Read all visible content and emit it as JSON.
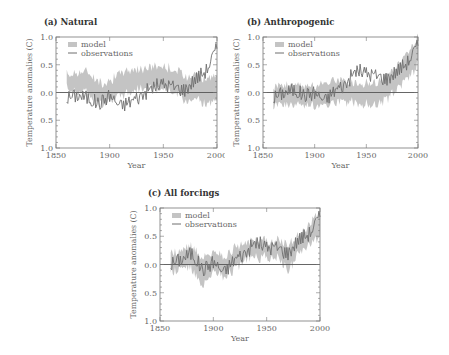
{
  "figure": {
    "panels": [
      {
        "id": "a",
        "title": "(a) Natural"
      },
      {
        "id": "b",
        "title": "(b) Anthropogenic"
      },
      {
        "id": "c",
        "title": "(c) All forcings"
      }
    ],
    "legend": {
      "model": "model",
      "observations": "observations"
    },
    "xlabel": "Year",
    "ylabel": "Temperature anomalies (C)",
    "xticks": [
      "1850",
      "1900",
      "1950",
      "2000"
    ],
    "yticks": [
      "1.0",
      "0.5",
      "0.0",
      "0.5",
      "1.0"
    ],
    "colors": {
      "model_band": "#c4c4c4",
      "observations": "#6e6e6e",
      "axis": "#777777",
      "zero_line": "#555555"
    }
  },
  "chart_data": [
    {
      "type": "line",
      "title": "(a) Natural",
      "xlabel": "Year",
      "ylabel": "Temperature anomalies (C)",
      "xlim": [
        1850,
        2000
      ],
      "ylim": [
        -1.0,
        1.0
      ],
      "xticks": [
        1850,
        1900,
        1950,
        2000
      ],
      "yticks": [
        1.0,
        0.5,
        0.0,
        -0.5,
        -1.0
      ],
      "ytick_labels": [
        "1.0",
        "0.5",
        "0.0",
        "0.5",
        "1.0"
      ],
      "legend": [
        "model",
        "observations"
      ],
      "legend_position": "upper left",
      "x": [
        1860,
        1870,
        1880,
        1890,
        1900,
        1910,
        1920,
        1930,
        1940,
        1950,
        1960,
        1970,
        1980,
        1990,
        2000
      ],
      "series": [
        {
          "name": "model",
          "kind": "band",
          "lower": [
            0.1,
            0.05,
            0.05,
            -0.2,
            -0.1,
            -0.05,
            0.05,
            0.1,
            0.1,
            0.1,
            0.05,
            -0.15,
            -0.05,
            -0.2,
            -0.1
          ],
          "upper": [
            0.3,
            0.35,
            0.35,
            0.15,
            0.2,
            0.3,
            0.4,
            0.4,
            0.45,
            0.45,
            0.4,
            0.25,
            0.35,
            0.2,
            0.3
          ]
        },
        {
          "name": "observations",
          "kind": "line",
          "values": [
            -0.1,
            -0.05,
            -0.1,
            -0.2,
            -0.05,
            -0.25,
            -0.15,
            -0.05,
            0.1,
            0.15,
            0.1,
            0.05,
            0.25,
            0.4,
            0.8
          ]
        }
      ]
    },
    {
      "type": "line",
      "title": "(b) Anthropogenic",
      "xlabel": "Year",
      "ylabel": "Temperature anomalies (C)",
      "xlim": [
        1850,
        2000
      ],
      "ylim": [
        -1.0,
        1.0
      ],
      "xticks": [
        1850,
        1900,
        1950,
        2000
      ],
      "yticks": [
        1.0,
        0.5,
        0.0,
        -0.5,
        -1.0
      ],
      "ytick_labels": [
        "1.0",
        "0.5",
        "0.0",
        "0.5",
        "1.0"
      ],
      "legend": [
        "model",
        "observations"
      ],
      "legend_position": "upper left",
      "x": [
        1860,
        1870,
        1880,
        1890,
        1900,
        1910,
        1920,
        1930,
        1940,
        1950,
        1960,
        1970,
        1980,
        1990,
        2000
      ],
      "series": [
        {
          "name": "model",
          "kind": "band",
          "lower": [
            -0.2,
            -0.2,
            -0.2,
            -0.2,
            -0.2,
            -0.2,
            -0.15,
            -0.15,
            -0.15,
            -0.2,
            -0.2,
            -0.1,
            0.1,
            0.3,
            0.5
          ],
          "upper": [
            0.1,
            0.1,
            0.1,
            0.1,
            0.1,
            0.15,
            0.2,
            0.15,
            0.15,
            0.15,
            0.15,
            0.25,
            0.45,
            0.7,
            0.95
          ]
        },
        {
          "name": "observations",
          "kind": "line",
          "values": [
            -0.1,
            0.0,
            0.05,
            -0.05,
            0.0,
            -0.15,
            0.05,
            0.15,
            0.4,
            0.35,
            0.3,
            0.25,
            0.4,
            0.55,
            0.85
          ]
        }
      ]
    },
    {
      "type": "line",
      "title": "(c) All forcings",
      "xlabel": "Year",
      "ylabel": "Temperature anomalies (C)",
      "xlim": [
        1850,
        2000
      ],
      "ylim": [
        -1.0,
        1.0
      ],
      "xticks": [
        1850,
        1900,
        1950,
        2000
      ],
      "yticks": [
        1.0,
        0.5,
        0.0,
        -0.5,
        -1.0
      ],
      "ytick_labels": [
        "1.0",
        "0.5",
        "0.0",
        "0.5",
        "1.0"
      ],
      "legend": [
        "model",
        "observations"
      ],
      "legend_position": "upper left",
      "x": [
        1860,
        1870,
        1880,
        1890,
        1900,
        1910,
        1920,
        1930,
        1940,
        1950,
        1960,
        1970,
        1980,
        1990,
        2000
      ],
      "series": [
        {
          "name": "model",
          "kind": "band",
          "lower": [
            -0.1,
            -0.05,
            -0.05,
            -0.35,
            -0.1,
            -0.2,
            -0.05,
            0.1,
            0.15,
            0.15,
            0.15,
            -0.1,
            0.25,
            0.35,
            0.55
          ],
          "upper": [
            0.2,
            0.2,
            0.3,
            0.1,
            0.2,
            0.1,
            0.25,
            0.35,
            0.4,
            0.4,
            0.4,
            0.3,
            0.5,
            0.65,
            0.95
          ]
        },
        {
          "name": "observations",
          "kind": "line",
          "values": [
            0.0,
            0.1,
            0.2,
            -0.1,
            0.05,
            -0.15,
            0.1,
            0.2,
            0.4,
            0.3,
            0.3,
            0.2,
            0.45,
            0.55,
            0.85
          ]
        }
      ]
    }
  ]
}
